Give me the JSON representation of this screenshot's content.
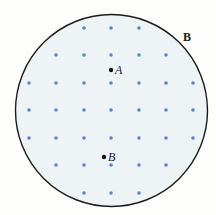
{
  "diagram": {
    "colors": {
      "background": "#fdfdfb",
      "region_fill": "#eef3f6",
      "region_border": "#1a1a1a",
      "field_dot": "#5b86c2",
      "point": "#111111"
    },
    "region": {
      "cx": 111.5,
      "cy": 110.5,
      "r": 96
    },
    "field_label": {
      "text": "B",
      "x": 183,
      "y": 41
    },
    "field_dots": {
      "radius": 1.8,
      "rows": [
        {
          "y": 28,
          "xs": [
            84,
            111,
            139
          ]
        },
        {
          "y": 55,
          "xs": [
            56,
            84,
            111,
            139,
            166
          ]
        },
        {
          "y": 83,
          "xs": [
            29,
            56,
            84,
            111,
            139,
            166,
            193
          ]
        },
        {
          "y": 110,
          "xs": [
            29,
            56,
            84,
            111,
            139,
            166,
            193
          ]
        },
        {
          "y": 138,
          "xs": [
            29,
            56,
            84,
            111,
            139,
            166,
            193
          ]
        },
        {
          "y": 165,
          "xs": [
            56,
            84,
            111,
            139,
            166
          ]
        },
        {
          "y": 193,
          "xs": [
            84,
            111,
            139
          ]
        }
      ]
    },
    "points": [
      {
        "label": "A",
        "x": 111,
        "y": 70,
        "label_x": 115,
        "label_y": 74
      },
      {
        "label": "B",
        "x": 104,
        "y": 157,
        "label_x": 108,
        "label_y": 161
      }
    ]
  }
}
